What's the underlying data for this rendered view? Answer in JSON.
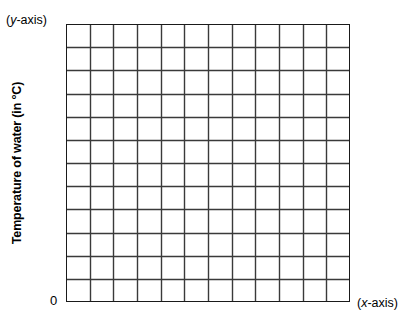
{
  "chart_data": {
    "type": "grid",
    "title": "",
    "xlabel": "(x-axis)",
    "ylabel": "Temperature of water (in °C)",
    "y_axis_caption": "(y-axis)",
    "origin_label": "0",
    "grid": {
      "columns": 12,
      "rows": 12,
      "show": true,
      "line_color": "#3a3a3a",
      "border_color": "#1a1a1a",
      "cell_fill": "#ffffff"
    },
    "xlim": [
      0,
      12
    ],
    "ylim": [
      0,
      12
    ],
    "xticks": [],
    "yticks": [],
    "series": [],
    "values": [],
    "categories": [],
    "legend": [],
    "annotations": [],
    "note": "Blank graph paper plotting grid: no plotted data, no numeric tick labels."
  },
  "figure": {
    "background": "#ffffff",
    "title": "",
    "y_axis_caption_prefix": "(",
    "y_axis_caption_italic": "y",
    "y_axis_caption_suffix": "-axis)",
    "x_axis_caption_prefix": "(",
    "x_axis_caption_italic": "x",
    "x_axis_caption_suffix": "-axis)",
    "y_axis_title": "Temperature of water (in °C)",
    "origin": "0"
  }
}
